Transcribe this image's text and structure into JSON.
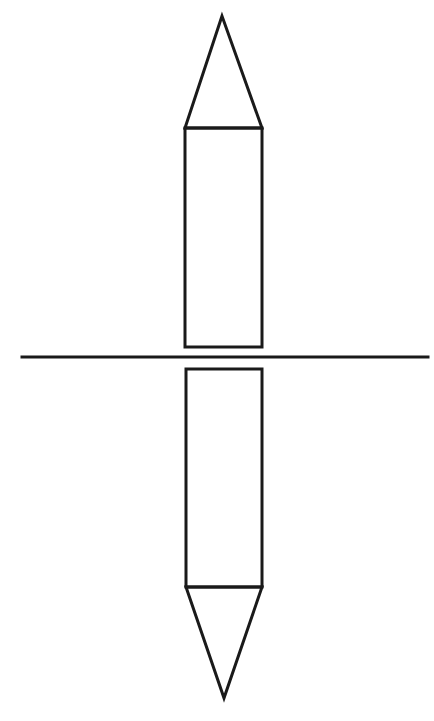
{
  "diagram": {
    "stroke_color": "#1a1a1a",
    "background": "#ffffff",
    "stroke_width": 3,
    "shapes": {
      "top_tip": {
        "type": "triangle",
        "points": [
          [
            222,
            16
          ],
          [
            185,
            128
          ],
          [
            262,
            128
          ]
        ]
      },
      "top_body": {
        "type": "rectangle",
        "x": 185,
        "y": 128,
        "width": 77,
        "height": 219
      },
      "mirror_line": {
        "type": "line",
        "x1": 22,
        "y1": 357,
        "x2": 428,
        "y2": 357
      },
      "bottom_body": {
        "type": "rectangle",
        "x": 186,
        "y": 369,
        "width": 76,
        "height": 218
      },
      "bottom_tip": {
        "type": "triangle",
        "points": [
          [
            186,
            587
          ],
          [
            262,
            587
          ],
          [
            224,
            698
          ]
        ]
      }
    }
  }
}
